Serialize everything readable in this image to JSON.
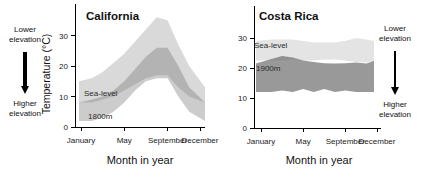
{
  "annotations": {
    "left": {
      "top": "Lower elevation",
      "bottom": "Higher elevation"
    },
    "right": {
      "top": "Lower elevation",
      "bottom": "Higher elevation"
    }
  },
  "chart_data": [
    {
      "id": "california",
      "type": "area",
      "title": "California",
      "xlabel": "Month in year",
      "ylabel": "Temperature (°C)",
      "months": [
        "Jan",
        "Feb",
        "Mar",
        "Apr",
        "May",
        "Jun",
        "Jul",
        "Aug",
        "Sep",
        "Oct",
        "Nov",
        "Dec"
      ],
      "x_tick_labels": [
        "January",
        "May",
        "September",
        "December"
      ],
      "x_tick_month_index": [
        0,
        4,
        8,
        11
      ],
      "y_ticks": [
        0,
        10,
        20,
        30
      ],
      "ylim": [
        0,
        37
      ],
      "grid": false,
      "legend_position": "in-plot",
      "bands": [
        {
          "name": "sea-level",
          "label": "Sea-level",
          "color": "#d9d9d9",
          "opacity": 1,
          "min": [
            8,
            8,
            9,
            10,
            12,
            14,
            16,
            17,
            17,
            13,
            10,
            8
          ],
          "max": [
            15,
            16,
            18,
            21,
            24,
            28,
            32,
            36,
            35,
            27,
            20,
            13
          ]
        },
        {
          "name": "1800m",
          "label": "1800m",
          "color": "#6e6e6e",
          "opacity": 0.35,
          "min": [
            2,
            2,
            3,
            5,
            8,
            12,
            15,
            16,
            16,
            10,
            5,
            2
          ],
          "max": [
            8,
            9,
            10,
            12,
            15,
            19,
            23,
            26,
            26,
            20,
            13,
            8
          ]
        }
      ]
    },
    {
      "id": "costarica",
      "type": "area",
      "title": "Costa Rica",
      "xlabel": "Month in year",
      "ylabel": "",
      "months": [
        "Jan",
        "Feb",
        "Mar",
        "Apr",
        "May",
        "Jun",
        "Jul",
        "Aug",
        "Sep",
        "Oct",
        "Nov",
        "Dec"
      ],
      "x_tick_labels": [
        "January",
        "May",
        "September",
        "December"
      ],
      "x_tick_month_index": [
        0,
        4,
        8,
        11
      ],
      "y_ticks": [
        0,
        10,
        20,
        30
      ],
      "ylim": [
        0,
        32
      ],
      "grid": false,
      "legend_position": "in-plot",
      "bands": [
        {
          "name": "sea-level",
          "label": "Sea-level",
          "color": "#e4e4e4",
          "opacity": 1,
          "min": [
            22.5,
            22.5,
            22.5,
            23,
            22.5,
            22.5,
            22.8,
            22.8,
            22.5,
            22,
            21.8,
            22
          ],
          "max": [
            29,
            29.5,
            29.5,
            29.5,
            29,
            28.5,
            28.5,
            28.5,
            29,
            30,
            29.5,
            29
          ]
        },
        {
          "name": "1900m",
          "label": "1900m",
          "color": "#5a5a5a",
          "opacity": 0.62,
          "min": [
            12,
            12,
            12.5,
            12,
            13,
            12,
            13,
            12,
            12.5,
            12,
            12,
            12
          ],
          "max": [
            21.5,
            23,
            24,
            23.5,
            22.5,
            22,
            21.6,
            21.5,
            21.6,
            21.8,
            21.5,
            22.3
          ]
        }
      ]
    }
  ]
}
